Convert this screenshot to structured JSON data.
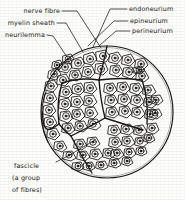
{
  "figure": {
    "type": "labelled-biological-diagram",
    "style": "hand-drawn line art, black ink on off-white paper",
    "ink_color": "#15130f",
    "paper_color": "#fdfdfb"
  },
  "labels": {
    "nerve_fibre": "nerve fibre",
    "myelin_sheath": "myelin sheath",
    "neurilemma": "neurilemma",
    "endoneurium": "endoneurium",
    "epineurium": "epineurium",
    "perineurium": "perineurium",
    "fascicle_line1": "fascicle",
    "fascicle_line2": "(a group",
    "fascicle_line3": "of fibres)"
  },
  "diagram_data": {
    "outer_circle": {
      "cx": 107,
      "cy": 112,
      "r": 66,
      "name": "epineurium-boundary"
    },
    "fascicle_count": 7,
    "nerve_fibre_count": 72,
    "fibre_structure": [
      "polygonal endoneurium cell outline",
      "myelin sheath ring",
      "axon dot"
    ],
    "leader_lines": [
      {
        "label": "nerve fibre",
        "from": [
          76,
          11
        ],
        "to": [
          101,
          48
        ]
      },
      {
        "label": "myelin sheath",
        "from": [
          61,
          23
        ],
        "to": [
          82,
          52
        ]
      },
      {
        "label": "neurilemma",
        "from": [
          55,
          35
        ],
        "to": [
          66,
          58
        ]
      },
      {
        "label": "endoneurium",
        "from": [
          108,
          9
        ],
        "to": [
          116,
          47
        ]
      },
      {
        "label": "epineurium",
        "from": [
          113,
          21
        ],
        "to": [
          92,
          48
        ]
      },
      {
        "label": "perineurium",
        "from": [
          114,
          31
        ],
        "to": [
          99,
          46
        ]
      },
      {
        "label": "fascicle",
        "from": [
          52,
          166
        ],
        "to": [
          92,
          146
        ]
      }
    ]
  }
}
